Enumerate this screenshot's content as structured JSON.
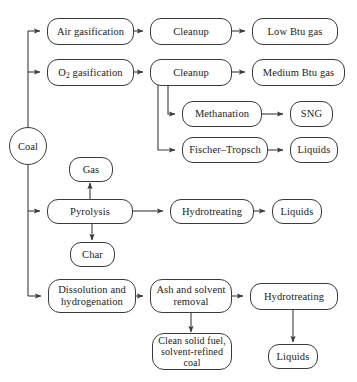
{
  "diagram": {
    "type": "flowchart",
    "background_color": "#ffffff",
    "line_color": "#3b3b3b",
    "text_color": "#1b1b1b"
  },
  "nodes": {
    "coal": "Coal",
    "air_gasification_pre": "Air gasification",
    "air_gasification_o": "",
    "o2_gasification_pre": "O",
    "o2_gasification_sub": "2",
    "o2_gasification_post": " gasification",
    "cleanup_1": "Cleanup",
    "cleanup_2": "Cleanup",
    "low_btu_gas": "Low Btu gas",
    "medium_btu_gas": "Medium Btu gas",
    "methanation": "Methanation",
    "sng": "SNG",
    "fischer_tropsch": "Fischer–Tropsch",
    "liquids_ft": "Liquids",
    "gas": "Gas",
    "pyrolysis": "Pyrolysis",
    "char": "Char",
    "hydrotreating_pyro": "Hydrotreating",
    "liquids_pyro": "Liquids",
    "dissolution_hydrogenation": "Dissolution and hydrogenation",
    "ash_solvent_removal": "Ash and solvent removal",
    "hydrotreating_liq": "Hydrotreating",
    "clean_solid_fuel": "Clean solid fuel, solvent-refined coal",
    "liquids_bottom": "Liquids"
  },
  "edges": [
    {
      "from": "coal",
      "to": "air_gasification",
      "label": ""
    },
    {
      "from": "coal",
      "to": "o2_gasification",
      "label": ""
    },
    {
      "from": "coal",
      "to": "pyrolysis",
      "label": ""
    },
    {
      "from": "coal",
      "to": "dissolution_hydrogenation",
      "label": ""
    },
    {
      "from": "air_gasification",
      "to": "cleanup_1",
      "label": ""
    },
    {
      "from": "cleanup_1",
      "to": "low_btu_gas",
      "label": ""
    },
    {
      "from": "o2_gasification",
      "to": "cleanup_2",
      "label": ""
    },
    {
      "from": "cleanup_2",
      "to": "medium_btu_gas",
      "label": ""
    },
    {
      "from": "cleanup_2",
      "to": "methanation",
      "label": ""
    },
    {
      "from": "methanation",
      "to": "sng",
      "label": ""
    },
    {
      "from": "cleanup_2",
      "to": "fischer_tropsch",
      "label": ""
    },
    {
      "from": "fischer_tropsch",
      "to": "liquids_ft",
      "label": ""
    },
    {
      "from": "pyrolysis",
      "to": "gas",
      "label": ""
    },
    {
      "from": "pyrolysis",
      "to": "char",
      "label": ""
    },
    {
      "from": "pyrolysis",
      "to": "hydrotreating_pyro",
      "label": ""
    },
    {
      "from": "hydrotreating_pyro",
      "to": "liquids_pyro",
      "label": ""
    },
    {
      "from": "dissolution_hydrogenation",
      "to": "ash_solvent_removal",
      "label": ""
    },
    {
      "from": "ash_solvent_removal",
      "to": "hydrotreating_liq",
      "label": ""
    },
    {
      "from": "ash_solvent_removal",
      "to": "clean_solid_fuel",
      "label": ""
    },
    {
      "from": "hydrotreating_liq",
      "to": "liquids_bottom",
      "label": ""
    }
  ]
}
